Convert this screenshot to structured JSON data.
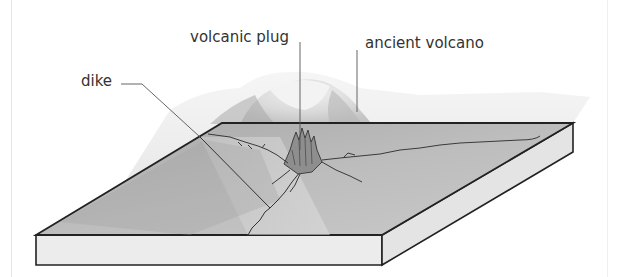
{
  "diagram": {
    "labels": {
      "volcanic_plug": "volcanic plug",
      "ancient_volcano": "ancient volcano",
      "dike": "dike"
    },
    "colors": {
      "background": "#ffffff",
      "outline": "#222222",
      "top_surface": "#b5b5b5",
      "side_face": "#ececec",
      "ancient_volcano_shadow": "#dcdcdc",
      "label_text": "#333333",
      "leader_line": "#555555"
    }
  }
}
